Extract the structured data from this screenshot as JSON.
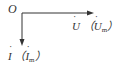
{
  "diagram": {
    "type": "phasor-diagram",
    "origin_label": "O",
    "voltage": {
      "symbol": "U",
      "amplitude_symbol": "U",
      "subscript": "m",
      "direction": "right"
    },
    "current": {
      "symbol": "I",
      "amplitude_symbol": "I",
      "subscript": "m",
      "direction": "down"
    },
    "colors": {
      "line": "#333333",
      "text": "#333333"
    }
  }
}
